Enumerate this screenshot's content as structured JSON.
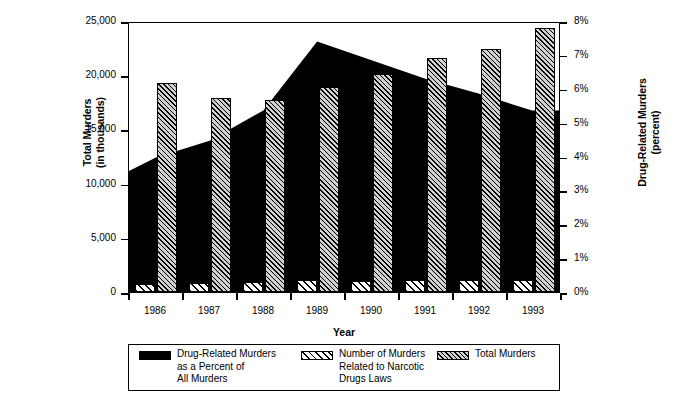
{
  "chart_data": {
    "type": "bar",
    "title": "",
    "subtitle": "",
    "xlabel": "Year",
    "ylabel": "Total Murders\n(in thousands)",
    "ylabel_line1": "Total Murders",
    "ylabel_line2": "(in thousands)",
    "y2label_line1": "Drug-Related Murders",
    "y2label_line2": "(percent)",
    "categories": [
      "1986",
      "1987",
      "1988",
      "1989",
      "1990",
      "1991",
      "1992",
      "1993"
    ],
    "ylim": [
      0,
      25000
    ],
    "y2lim": [
      0,
      8
    ],
    "yticks": [
      0,
      5000,
      10000,
      15000,
      20000,
      25000
    ],
    "ytick_labels": [
      "0",
      "5,000",
      "10,000",
      "15,000",
      "20,000",
      "25,000"
    ],
    "y2ticks": [
      0,
      1,
      2,
      3,
      4,
      5,
      6,
      7,
      8
    ],
    "y2tick_labels": [
      "0%",
      "1%",
      "2%",
      "3%",
      "4%",
      "5%",
      "6%",
      "7%",
      "8%"
    ],
    "grid": false,
    "legend_position": "bottom",
    "series": [
      {
        "name": "Drug-Related Murders as a Percent of All Murders",
        "legend_label": "Drug-Related Murders\nas a Percent of\nAll Murders",
        "type": "area",
        "axis": "right",
        "unit": "percent",
        "pattern": "solid-black",
        "color": "#000000",
        "values": [
          4.0,
          4.5,
          5.4,
          7.45,
          6.9,
          6.35,
          5.9,
          5.4
        ],
        "edge_values": [
          3.6,
          4.55,
          5.35,
          7.45,
          6.9,
          6.35,
          5.85,
          5.4
        ]
      },
      {
        "name": "Number of Murders Related to Narcotic Drugs Laws",
        "legend_label": "Number of Murders\nRelated to Narcotic\nDrugs Laws",
        "type": "bar",
        "axis": "left",
        "unit": "thousands",
        "pattern": "wide-diagonal-hatch",
        "color": "#ffffff",
        "values": [
          700,
          800,
          900,
          1150,
          1050,
          1100,
          1100,
          1150
        ]
      },
      {
        "name": "Total Murders",
        "legend_label": "Total Murders",
        "type": "bar",
        "axis": "left",
        "unit": "thousands",
        "pattern": "dense-diagonal-hatch",
        "color": "#d0d0d0",
        "values": [
          19300,
          17900,
          17700,
          18900,
          20100,
          21600,
          22400,
          24400
        ]
      }
    ]
  },
  "legend": {
    "entries": [
      {
        "label": "Drug-Related Murders\nas a Percent of\nAll Murders",
        "swatch": "solid"
      },
      {
        "label": "Number of Murders\nRelated to Narcotic\nDrugs Laws",
        "swatch": "narco"
      },
      {
        "label": "Total Murders",
        "swatch": "total"
      }
    ]
  },
  "colors": {
    "axis": "#000000",
    "area_fill": "#000000",
    "total_bar": "#d0d0d0",
    "narcotic_bar": "#ffffff",
    "background": "#ffffff"
  }
}
